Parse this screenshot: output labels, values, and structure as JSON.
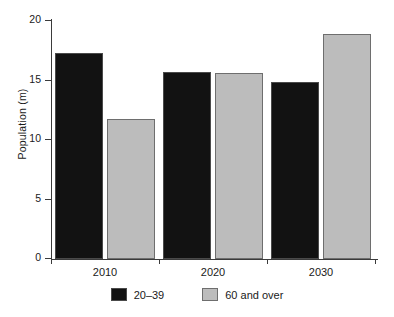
{
  "chart_data": {
    "type": "bar",
    "title": "",
    "xlabel": "",
    "ylabel": "Population (m)",
    "categories": [
      "2010",
      "2020",
      "2030"
    ],
    "series": [
      {
        "name": "20–39",
        "color": "#121212",
        "values": [
          17.3,
          15.7,
          14.9
        ]
      },
      {
        "name": "60 and over",
        "color": "#bcbcbc",
        "values": [
          11.8,
          15.6,
          18.9
        ]
      }
    ],
    "ylim": [
      0,
      20
    ],
    "yticks": [
      0,
      5,
      10,
      15,
      20
    ],
    "ytick_labels": [
      "0",
      "5",
      "10",
      "15",
      "20"
    ],
    "grid": false,
    "legend_position": "bottom"
  }
}
